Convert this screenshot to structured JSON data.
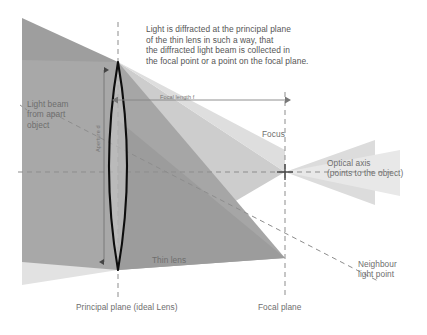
{
  "diagram": {
    "note": "Light is diffracted at the principal plane\nof the thin lens in such a way, that\nthe diffracted light beam is collected in\nthe focal point or a point on the focal plane.",
    "labels": {
      "light_beam": "Light beam\nfrom apart\nobject",
      "focal_length": "Focal length f",
      "aperture": "Aperture d",
      "focus": "Focus",
      "optical_axis": "Optical axis\n(points to the object)",
      "neighbour_light_point": "Neighbour\nlight point",
      "thin_lens": "Thin lens",
      "principal_plane": "Principal plane (ideal Lens)",
      "focal_plane": "Focal plane"
    },
    "colors": {
      "beam_dark": "#9a9a9a",
      "beam_medium": "#b4b4b4",
      "beam_light": "#d2d2d2",
      "beam_faint": "#e6e6e6",
      "lens_fill": "#cfcfcf",
      "lens_stroke": "#111111",
      "dashed_line": "#8d8d8d",
      "text": "#6e6e6e",
      "arrow": "#777777"
    },
    "geometry": {
      "principal_plane_x": 118,
      "optical_axis_y": 172,
      "focal_plane_x": 285,
      "focus_point": [
        285,
        172
      ],
      "neighbour_focus_point": [
        285,
        258
      ],
      "lens_top": [
        118,
        62
      ],
      "lens_bottom": [
        118,
        270
      ],
      "lens_half_width": 18,
      "focal_length_arrow_y": 100
    }
  }
}
